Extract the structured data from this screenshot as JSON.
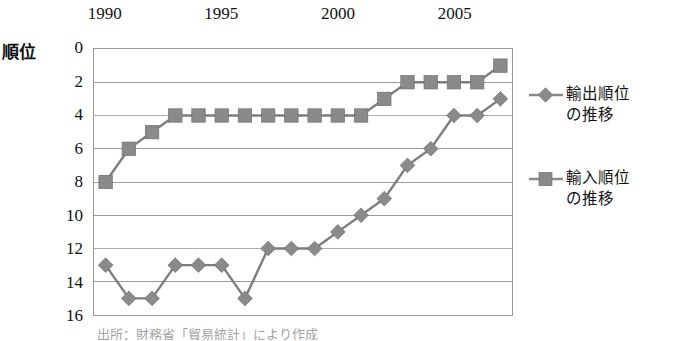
{
  "chart_data": {
    "type": "line",
    "title": "",
    "xlabel": "",
    "ylabel": "順位",
    "x": [
      1990,
      1991,
      1992,
      1993,
      1994,
      1995,
      1996,
      1997,
      1998,
      1999,
      2000,
      2001,
      2002,
      2003,
      2004,
      2005,
      2006,
      2007
    ],
    "xlim": [
      1989.5,
      2007.5
    ],
    "ylim": [
      0,
      16
    ],
    "y_inverted": true,
    "grid": true,
    "legend_position": "right",
    "x_ticks": [
      1990,
      1995,
      2000,
      2005
    ],
    "x_tick_labels": [
      "1990",
      "1995",
      "2000",
      "2005"
    ],
    "y_ticks": [
      0,
      2,
      4,
      6,
      8,
      10,
      12,
      14,
      16
    ],
    "y_tick_labels": [
      "0",
      "2",
      "4",
      "6",
      "8",
      "10",
      "12",
      "14",
      "16"
    ],
    "series": [
      {
        "name": "輸出順位\nの推移",
        "name_flat": "輸出順位の推移",
        "marker": "diamond",
        "color": "#8a8a8a",
        "values": [
          13,
          15,
          15,
          13,
          13,
          13,
          15,
          12,
          12,
          12,
          11,
          10,
          9,
          7,
          6,
          4,
          4,
          3
        ]
      },
      {
        "name": "輸入順位\nの推移",
        "name_flat": "輸入順位の推移",
        "marker": "square",
        "color": "#8a8a8a",
        "values": [
          8,
          6,
          5,
          4,
          4,
          4,
          4,
          4,
          4,
          4,
          4,
          4,
          3,
          2,
          2,
          2,
          2,
          1
        ]
      }
    ]
  },
  "footnote": "出所：財務省「貿易統計」により作成"
}
